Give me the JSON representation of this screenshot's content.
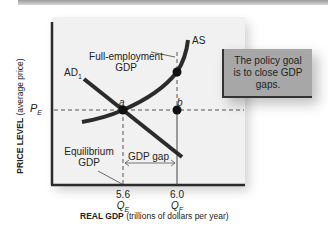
{
  "diagram": {
    "y_axis_label_bold": "PRICE LEVEL",
    "y_axis_label_rest": " (average price)",
    "x_axis_label_bold": "REAL GDP",
    "x_axis_label_rest": " (trillions of dollars per year)",
    "price_level_label": "P",
    "price_level_sub": "E",
    "curves": {
      "ad_label": "AD",
      "ad_sub": "1",
      "as_label": "AS"
    },
    "points": {
      "a": "a",
      "b": "b"
    },
    "annotations": {
      "full_employment_line1": "Full-employment",
      "full_employment_line2": "GDP",
      "equilibrium_line1": "Equilibrium",
      "equilibrium_line2": "GDP",
      "gdp_gap": "GDP gap"
    },
    "x_ticks": [
      {
        "value": "5.6",
        "label": "Q",
        "sub": "E"
      },
      {
        "value": "6.0",
        "label": "Q",
        "sub": "F"
      }
    ],
    "policy_note": "The policy goal is to close GDP gaps.",
    "colors": {
      "plot_background": "#f1f1f1",
      "curve": "#2b2b2b",
      "policy_box": "#a7a7a7"
    }
  }
}
